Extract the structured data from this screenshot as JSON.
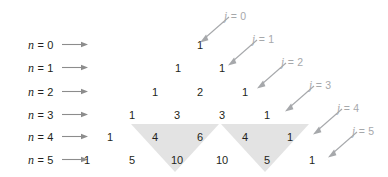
{
  "figure": {
    "colors": {
      "text": "#231f20",
      "shade": "#e3e3e3",
      "arrow_gray": "#a6a8ab",
      "row_arrow": "#8c8c8c",
      "background": "#ffffff"
    }
  },
  "row_labels": [
    {
      "text": "n = 0",
      "var": "n",
      "eq": "= 0",
      "y": 45
    },
    {
      "text": "n = 1",
      "var": "n",
      "eq": "= 1",
      "y": 68
    },
    {
      "text": "n = 2",
      "var": "n",
      "eq": "= 2",
      "y": 92
    },
    {
      "text": "n = 3",
      "var": "n",
      "eq": "= 3",
      "y": 115
    },
    {
      "text": "n = 4",
      "var": "n",
      "eq": "= 4",
      "y": 137
    },
    {
      "text": "n = 5",
      "var": "n",
      "eq": "= 5",
      "y": 160
    }
  ],
  "diagonal_labels": [
    {
      "text": "j = 0",
      "var": "j",
      "eq": "= 0",
      "x": 224,
      "y": 10
    },
    {
      "text": "j = 1",
      "var": "j",
      "eq": "= 1",
      "x": 252,
      "y": 33
    },
    {
      "text": "j = 2",
      "var": "j",
      "eq": "= 2",
      "x": 281,
      "y": 56
    },
    {
      "text": "j = 3",
      "var": "j",
      "eq": "= 3",
      "x": 309,
      "y": 79
    },
    {
      "text": "j = 4",
      "var": "j",
      "eq": "= 4",
      "x": 337,
      "y": 102
    },
    {
      "text": "j = 5",
      "var": "j",
      "eq": "= 5",
      "x": 352,
      "y": 125
    }
  ],
  "chart_data": {
    "type": "table",
    "xlabel": "j",
    "ylabel": "n",
    "rows": [
      {
        "n": 0,
        "values": [
          1
        ]
      },
      {
        "n": 1,
        "values": [
          1,
          1
        ]
      },
      {
        "n": 2,
        "values": [
          1,
          2,
          1
        ]
      },
      {
        "n": 3,
        "values": [
          1,
          3,
          3,
          1
        ]
      },
      {
        "n": 4,
        "values": [
          1,
          4,
          6,
          4,
          1
        ]
      },
      {
        "n": 5,
        "values": [
          1,
          5,
          10,
          10,
          5,
          1
        ]
      }
    ],
    "cells": [
      {
        "n": 0,
        "j": 0,
        "value": "1",
        "x": 200,
        "y": 45
      },
      {
        "n": 1,
        "j": 0,
        "value": "1",
        "x": 178,
        "y": 68
      },
      {
        "n": 1,
        "j": 1,
        "value": "1",
        "x": 222,
        "y": 68
      },
      {
        "n": 2,
        "j": 0,
        "value": "1",
        "x": 155,
        "y": 92
      },
      {
        "n": 2,
        "j": 1,
        "value": "2",
        "x": 200,
        "y": 92
      },
      {
        "n": 2,
        "j": 2,
        "value": "1",
        "x": 245,
        "y": 92
      },
      {
        "n": 3,
        "j": 0,
        "value": "1",
        "x": 132,
        "y": 115
      },
      {
        "n": 3,
        "j": 1,
        "value": "3",
        "x": 177,
        "y": 115
      },
      {
        "n": 3,
        "j": 2,
        "value": "3",
        "x": 222,
        "y": 115
      },
      {
        "n": 3,
        "j": 3,
        "value": "1",
        "x": 267,
        "y": 115
      },
      {
        "n": 4,
        "j": 0,
        "value": "1",
        "x": 110,
        "y": 137
      },
      {
        "n": 4,
        "j": 1,
        "value": "4",
        "x": 155,
        "y": 137
      },
      {
        "n": 4,
        "j": 2,
        "value": "6",
        "x": 200,
        "y": 137
      },
      {
        "n": 4,
        "j": 3,
        "value": "4",
        "x": 245,
        "y": 137
      },
      {
        "n": 4,
        "j": 4,
        "value": "1",
        "x": 290,
        "y": 137
      },
      {
        "n": 5,
        "j": 0,
        "value": "1",
        "x": 87,
        "y": 160
      },
      {
        "n": 5,
        "j": 1,
        "value": "5",
        "x": 132,
        "y": 160
      },
      {
        "n": 5,
        "j": 2,
        "value": "10",
        "x": 177,
        "y": 160
      },
      {
        "n": 5,
        "j": 3,
        "value": "10",
        "x": 222,
        "y": 160
      },
      {
        "n": 5,
        "j": 4,
        "value": "5",
        "x": 267,
        "y": 160
      },
      {
        "n": 5,
        "j": 5,
        "value": "1",
        "x": 312,
        "y": 160
      }
    ],
    "highlight_triangles": [
      {
        "left": 131,
        "right": 219,
        "top": 124,
        "apex_x": 175,
        "apex_y": 172
      },
      {
        "left": 221,
        "right": 309,
        "top": 124,
        "apex_x": 265,
        "apex_y": 172
      }
    ]
  }
}
